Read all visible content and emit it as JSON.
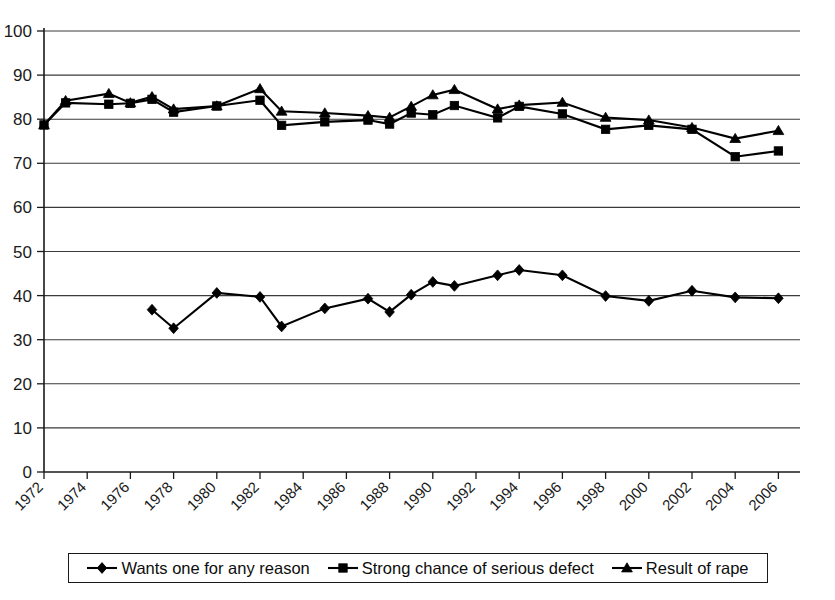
{
  "chart_data": {
    "type": "line",
    "title": "",
    "subtitle": "",
    "xlabel": "",
    "ylabel": "",
    "xlim": [
      1972,
      2007
    ],
    "ylim": [
      0,
      100
    ],
    "ytick_step": 10,
    "xtick_step": 2,
    "grid": "horizontal",
    "legend_position": "bottom",
    "yticks": [
      "0",
      "10",
      "20",
      "30",
      "40",
      "50",
      "60",
      "70",
      "80",
      "90",
      "100"
    ],
    "xticks": [
      "1972",
      "1974",
      "1976",
      "1978",
      "1980",
      "1982",
      "1984",
      "1986",
      "1988",
      "1990",
      "1992",
      "1994",
      "1996",
      "1998",
      "2000",
      "2002",
      "2004",
      "2006"
    ],
    "series": [
      {
        "name": "Wants one for any reason",
        "marker": "diamond",
        "color": "#000000",
        "points": [
          {
            "x": 1977,
            "y": 36.8
          },
          {
            "x": 1978,
            "y": 32.6
          },
          {
            "x": 1980,
            "y": 40.6
          },
          {
            "x": 1982,
            "y": 39.7
          },
          {
            "x": 1983,
            "y": 33.0
          },
          {
            "x": 1985,
            "y": 37.1
          },
          {
            "x": 1987,
            "y": 39.3
          },
          {
            "x": 1988,
            "y": 36.3
          },
          {
            "x": 1989,
            "y": 40.2
          },
          {
            "x": 1990,
            "y": 43.1
          },
          {
            "x": 1991,
            "y": 42.2
          },
          {
            "x": 1993,
            "y": 44.6
          },
          {
            "x": 1994,
            "y": 45.8
          },
          {
            "x": 1996,
            "y": 44.6
          },
          {
            "x": 1998,
            "y": 39.9
          },
          {
            "x": 2000,
            "y": 38.8
          },
          {
            "x": 2002,
            "y": 41.1
          },
          {
            "x": 2004,
            "y": 39.6
          },
          {
            "x": 2006,
            "y": 39.4
          }
        ]
      },
      {
        "name": "Strong chance of serious defect",
        "marker": "square",
        "color": "#000000",
        "points": [
          {
            "x": 1972,
            "y": 78.7
          },
          {
            "x": 1973,
            "y": 83.7
          },
          {
            "x": 1975,
            "y": 83.4
          },
          {
            "x": 1976,
            "y": 83.6
          },
          {
            "x": 1977,
            "y": 84.5
          },
          {
            "x": 1978,
            "y": 81.6
          },
          {
            "x": 1980,
            "y": 83.0
          },
          {
            "x": 1982,
            "y": 84.3
          },
          {
            "x": 1983,
            "y": 78.6
          },
          {
            "x": 1985,
            "y": 79.4
          },
          {
            "x": 1987,
            "y": 79.8
          },
          {
            "x": 1988,
            "y": 78.9
          },
          {
            "x": 1989,
            "y": 81.4
          },
          {
            "x": 1990,
            "y": 81.0
          },
          {
            "x": 1991,
            "y": 83.1
          },
          {
            "x": 1993,
            "y": 80.3
          },
          {
            "x": 1994,
            "y": 82.9
          },
          {
            "x": 1996,
            "y": 81.2
          },
          {
            "x": 1998,
            "y": 77.7
          },
          {
            "x": 2000,
            "y": 78.6
          },
          {
            "x": 2002,
            "y": 77.7
          },
          {
            "x": 2004,
            "y": 71.5
          },
          {
            "x": 2006,
            "y": 72.8
          }
        ]
      },
      {
        "name": "Result of rape",
        "marker": "triangle",
        "color": "#000000",
        "points": [
          {
            "x": 1972,
            "y": 78.7
          },
          {
            "x": 1973,
            "y": 84.2
          },
          {
            "x": 1975,
            "y": 85.8
          },
          {
            "x": 1976,
            "y": 83.7
          },
          {
            "x": 1977,
            "y": 85.1
          },
          {
            "x": 1978,
            "y": 82.3
          },
          {
            "x": 1980,
            "y": 83.0
          },
          {
            "x": 1982,
            "y": 86.9
          },
          {
            "x": 1983,
            "y": 81.8
          },
          {
            "x": 1985,
            "y": 81.4
          },
          {
            "x": 1987,
            "y": 80.8
          },
          {
            "x": 1988,
            "y": 80.4
          },
          {
            "x": 1989,
            "y": 82.9
          },
          {
            "x": 1990,
            "y": 85.5
          },
          {
            "x": 1991,
            "y": 86.7
          },
          {
            "x": 1993,
            "y": 82.3
          },
          {
            "x": 1994,
            "y": 83.2
          },
          {
            "x": 1996,
            "y": 83.8
          },
          {
            "x": 1998,
            "y": 80.4
          },
          {
            "x": 2000,
            "y": 79.8
          },
          {
            "x": 2002,
            "y": 78.1
          },
          {
            "x": 2004,
            "y": 75.6
          },
          {
            "x": 2006,
            "y": 77.4
          }
        ]
      }
    ]
  },
  "legend": {
    "items": [
      {
        "label": "Wants one for any reason",
        "marker": "diamond"
      },
      {
        "label": "Strong chance of serious defect",
        "marker": "square"
      },
      {
        "label": "Result of rape",
        "marker": "triangle"
      }
    ]
  }
}
